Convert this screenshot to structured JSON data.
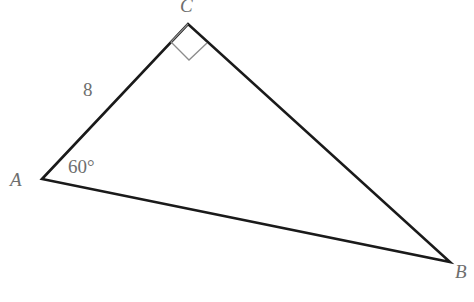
{
  "figure": {
    "kind": "geometry-diagram",
    "shape": "triangle",
    "background_color": "#ffffff",
    "stroke_color": "#1a1a1a",
    "stroke_width": 2.6,
    "label_color": "#6e6e6e",
    "marker_color": "#8c8c8c",
    "marker_width": 1.3,
    "width": 474,
    "height": 302
  },
  "vertices": {
    "A": {
      "label": "A",
      "x": 42,
      "y": 179
    },
    "B": {
      "label": "B",
      "x": 450,
      "y": 262
    },
    "C": {
      "label": "C",
      "x": 188,
      "y": 24
    }
  },
  "sides": [
    {
      "name": "AC",
      "from": "A",
      "to": "C",
      "length_label": "8"
    },
    {
      "name": "CB",
      "from": "C",
      "to": "B",
      "length_label": ""
    },
    {
      "name": "AB",
      "from": "A",
      "to": "B",
      "length_label": ""
    }
  ],
  "angles": [
    {
      "at": "A",
      "label": "60°",
      "marker": "none"
    },
    {
      "at": "C",
      "label": "",
      "marker": "right-angle-square"
    }
  ],
  "annotations": {
    "side_ac_length": "8",
    "angle_a_measure": "60°",
    "vertex_a": "A",
    "vertex_b": "B",
    "vertex_c": "C"
  },
  "right_angle_marker": {
    "at_vertex": "C",
    "points": "188,24 171,42 189,60 207,43"
  },
  "paths": {
    "triangle": "M 42,179 L 188,24 L 450,262 Z"
  }
}
